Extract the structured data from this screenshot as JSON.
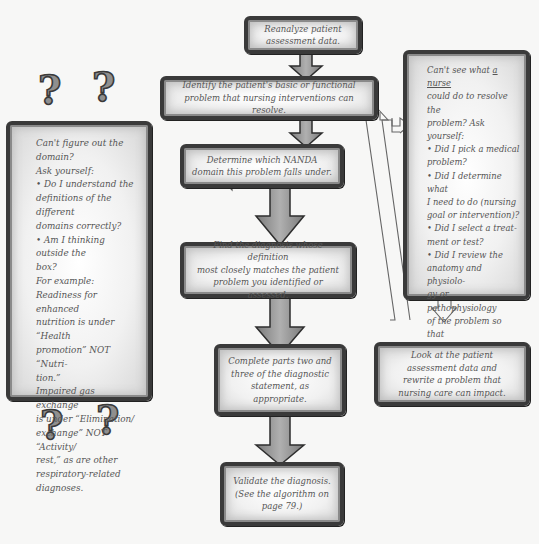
{
  "diagram": {
    "flow_boxes": [
      {
        "id": "reanalyze",
        "text": "Reanalyze patient\nassessment data."
      },
      {
        "id": "identify",
        "text": "Identify the patient's basic or functional\nproblem that nursing interventions can resolve."
      },
      {
        "id": "determine",
        "text": "Determine which NANDA\ndomain this problem falls under."
      },
      {
        "id": "find",
        "text": "Find the diagnosis whose definition\nmost closely matches the patient\nproblem you identified or assessed."
      },
      {
        "id": "complete",
        "text": "Complete parts two and\nthree of the diagnostic\nstatement, as appropriate."
      },
      {
        "id": "validate",
        "text": "Validate the diagnosis.\n(See the algorithm on\npage 79.)"
      }
    ],
    "left_box": {
      "lines": [
        "Can't figure out the domain?",
        "Ask yourself:",
        "• Do I understand the",
        "definitions of the different",
        "domains correctly?",
        "• Am I thinking outside the",
        "box?",
        "For example:",
        "Readiness for enhanced",
        "nutrition is under “Health",
        "promotion” NOT “Nutri-",
        "tion.”",
        "Impaired gas exchange",
        "is under “Elimination/",
        "exchange” NOT “Activity/",
        "rest,” as are other",
        "respiratory-related",
        "diagnoses."
      ]
    },
    "right_box": {
      "line1_pre": "Can't see what ",
      "line1_underline": "a nurse",
      "lines": [
        "could do to resolve the",
        "problem? Ask yourself:",
        "• Did I pick a medical",
        "problem?",
        "• Did I determine what",
        "I need to do (nursing",
        "goal or intervention)?",
        "• Did I select a treat-",
        "ment or test?",
        "• Did I review the",
        "anatomy and physiolo-",
        "gy or pathophysiology",
        "of the problem so that",
        "I understand the un-",
        "derlying issues?"
      ]
    },
    "rewrite_box": {
      "text": "Look at the patient\nassessment data and\nrewrite a problem that\nnursing care can impact."
    },
    "decorations": {
      "question_mark": "?"
    },
    "colors": {
      "border": "#3a3a3a",
      "arrow_fill": "#9a9a9a",
      "text": "#555555",
      "background": "#f7f7f6"
    }
  }
}
